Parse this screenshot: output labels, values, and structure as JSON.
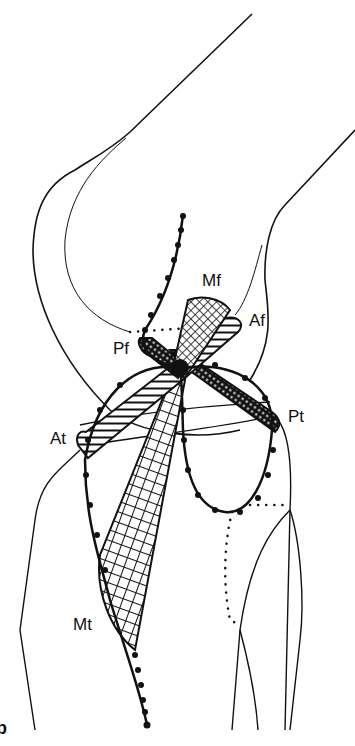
{
  "figure": {
    "panel_label": "b",
    "labels": {
      "mf": "Mf",
      "af": "Af",
      "pf": "Pf",
      "at": "At",
      "pt": "Pt",
      "mt": "Mt"
    },
    "colors": {
      "ink": "#111111",
      "background": "#ffffff"
    }
  }
}
